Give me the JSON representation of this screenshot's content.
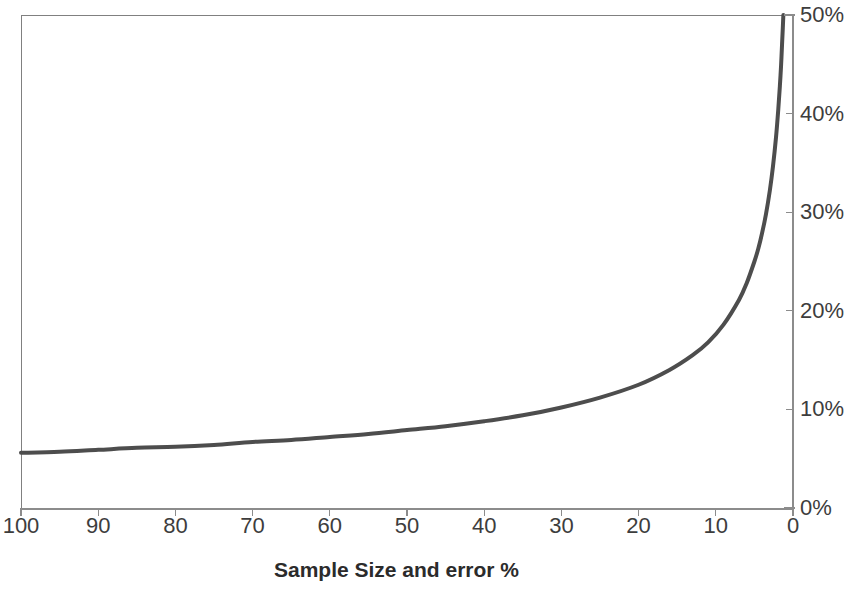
{
  "chart_data": {
    "type": "line",
    "title": "",
    "subtitle": "",
    "xlabel": "Sample Size and error %",
    "ylabel": "",
    "xlim": [
      100,
      0
    ],
    "ylim": [
      0,
      50
    ],
    "x_axis_reversed": true,
    "grid": false,
    "legend": null,
    "legend_position": "none",
    "x_tick_labels": [
      "100",
      "90",
      "80",
      "70",
      "60",
      "50",
      "40",
      "30",
      "20",
      "10",
      "0"
    ],
    "x_tick_values": [
      100,
      90,
      80,
      70,
      60,
      50,
      40,
      30,
      20,
      10,
      0
    ],
    "y_tick_labels": [
      "0%",
      "10%",
      "20%",
      "30%",
      "40%",
      "50%"
    ],
    "y_tick_values": [
      0,
      10,
      20,
      30,
      40,
      50
    ],
    "series": [
      {
        "name": "Margin of error",
        "color": "#4d4d4d",
        "line_width": 4,
        "x": [
          100,
          95,
          90,
          85,
          80,
          75,
          70,
          65,
          60,
          55,
          50,
          45,
          40,
          35,
          30,
          25,
          20,
          16,
          13,
          11,
          9,
          7,
          6,
          5,
          4.5,
          4,
          3.5,
          3,
          2.6,
          2.2,
          1.9,
          1.7,
          1.55,
          1.42,
          1.32,
          1.25
        ],
        "values": [
          5.6,
          5.7,
          5.9,
          6.1,
          6.2,
          6.4,
          6.7,
          6.9,
          7.2,
          7.5,
          7.9,
          8.3,
          8.8,
          9.4,
          10.2,
          11.2,
          12.5,
          14.0,
          15.5,
          16.8,
          18.6,
          21.1,
          22.8,
          25.0,
          26.3,
          27.9,
          29.8,
          32.2,
          34.6,
          37.6,
          40.5,
          42.8,
          44.8,
          47.0,
          48.7,
          50.0
        ]
      }
    ],
    "annotations": []
  },
  "axis": {
    "x_title": "Sample Size and error %"
  },
  "colors": {
    "series": "#4d4d4d",
    "axis": "#8c8c8c",
    "frame": "#808080",
    "text": "#3d3d3d",
    "title": "#2b2b2b",
    "background": "#ffffff"
  }
}
